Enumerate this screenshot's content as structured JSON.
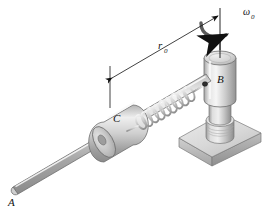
{
  "figure": {
    "background_color": "#ffffff",
    "line_color": "#111111",
    "labels": {
      "rod_end": "A",
      "vertical_post": "B",
      "collar": "C",
      "dimension": "r",
      "dimension_subscript": "0",
      "angular_velocity": "ω",
      "angular_velocity_subscript": "0"
    },
    "components": [
      {
        "name": "slender-rod",
        "label": "A",
        "description": "long cylindrical rod inclined from lower-left to upper-right"
      },
      {
        "name": "sliding-collar",
        "label": "C",
        "description": "cylindrical collar sliding on the rod"
      },
      {
        "name": "helical-spring",
        "label": "",
        "description": "coil spring between collar C and post B"
      },
      {
        "name": "vertical-post",
        "label": "B",
        "description": "upright cylindrical post carrying the rod pivot"
      },
      {
        "name": "base-plate",
        "label": "",
        "description": "square base plate supporting the post"
      },
      {
        "name": "rotation-axis",
        "label": "",
        "description": "vertical centerline through B"
      },
      {
        "name": "rotation-arrow",
        "label": "ω₀",
        "description": "curved arrow indicating spin about the vertical axis"
      },
      {
        "name": "dimension-line",
        "label": "r₀",
        "description": "double-arrow dimension from collar C station to the rotation axis"
      }
    ],
    "colors": {
      "metal_light": "#f2f2f2",
      "metal_mid": "#c9c9c9",
      "metal_dark": "#9a9a9a",
      "metal_shadow": "#7d7d7d",
      "outline": "#6f6f6f"
    }
  }
}
